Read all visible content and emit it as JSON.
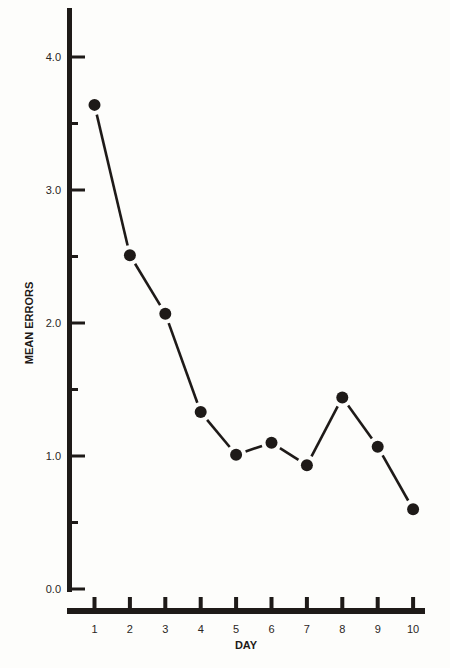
{
  "chart_data": {
    "type": "line",
    "title": "",
    "xlabel": "DAY",
    "ylabel": "MEAN ERRORS",
    "x": [
      1,
      2,
      3,
      4,
      5,
      6,
      7,
      8,
      9,
      10
    ],
    "series": [
      {
        "name": "Mean errors",
        "values": [
          3.64,
          2.51,
          2.07,
          1.33,
          1.01,
          1.1,
          0.93,
          1.44,
          1.07,
          0.6
        ]
      }
    ],
    "ylim": [
      0.0,
      4.0
    ],
    "xlim": [
      1,
      10
    ],
    "y_ticks_labeled": [
      "0.0",
      "1.0",
      "2.0",
      "3.0",
      "4.0"
    ],
    "y_minor_ticks": [
      0.5,
      1.5,
      2.5,
      3.5
    ],
    "x_tick_labels": [
      "1",
      "2",
      "3",
      "4",
      "5",
      "6",
      "7",
      "8",
      "9",
      "10"
    ],
    "grid": false,
    "legend": "none",
    "markers": "filled-circle"
  },
  "colors": {
    "ink": "#1e1a18",
    "background": "#fdfdfb"
  }
}
